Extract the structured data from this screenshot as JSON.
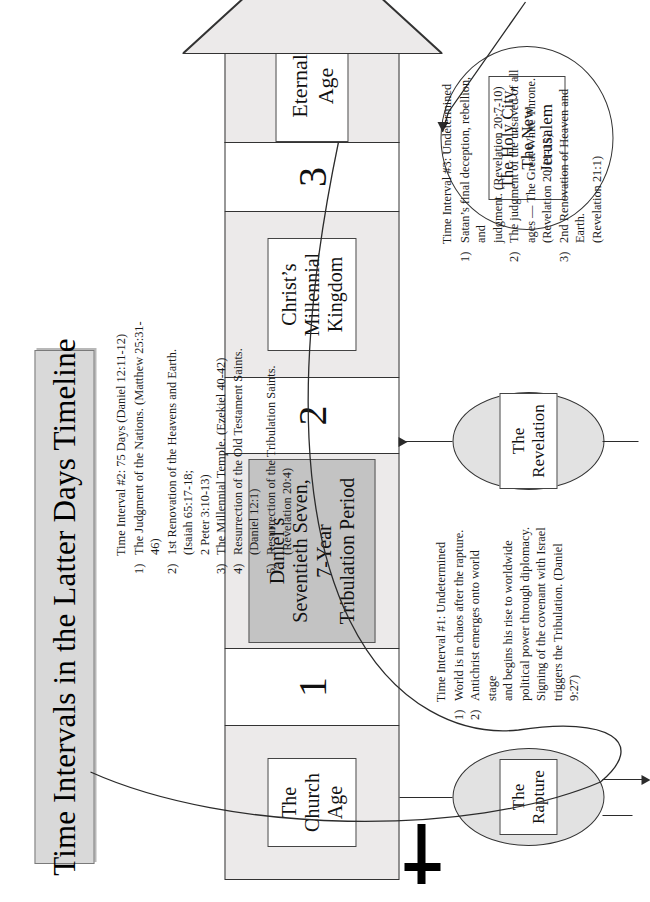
{
  "title": "Time Intervals in the Latter Days Timeline",
  "timeline": {
    "segments": [
      {
        "key": "church-age",
        "kind": "era",
        "label": "The Church Age"
      },
      {
        "key": "interval-1",
        "kind": "interval",
        "label": "1"
      },
      {
        "key": "tribulation",
        "kind": "era",
        "label": "Daniel’s Seventieth Seven, 7-Year Tribulation Period"
      },
      {
        "key": "interval-2",
        "kind": "interval",
        "label": "2"
      },
      {
        "key": "millennial-kingdom",
        "kind": "era",
        "label": "Christ’s Millennial Kingdom"
      },
      {
        "key": "interval-3",
        "kind": "interval",
        "label": "3"
      },
      {
        "key": "eternal-age",
        "kind": "era",
        "label": "Eternal Age"
      }
    ],
    "era_labels": {
      "church_age": [
        "The",
        "Church",
        "Age"
      ],
      "tribulation": [
        "Daniel’s",
        "Seventieth Seven,",
        "7-Year",
        "Tribulation Period"
      ],
      "millennial": [
        "Christ’s",
        "Millennial",
        "Kingdom"
      ],
      "eternal": [
        "Eternal Age"
      ]
    }
  },
  "callouts": {
    "rapture": [
      "The",
      "Rapture"
    ],
    "revelation": [
      "The",
      "Revelation"
    ],
    "holy_city": [
      "The Holy City,",
      "The New",
      "Jerusalem"
    ]
  },
  "notes": {
    "interval1": {
      "heading": "Time Interval #1: Undetermined",
      "items": [
        {
          "marker": "1)",
          "lines": [
            "World is in chaos after the rapture."
          ]
        },
        {
          "marker": "2)",
          "lines": [
            "Antichrist emerges onto world stage",
            "and begins his rise to worldwide",
            "political power through diplomacy.",
            "Signing of the covenant with Israel",
            "triggers the Tribulation. (Daniel 9:27)"
          ]
        }
      ]
    },
    "interval2": {
      "heading": "Time Interval #2: 75 Days (Daniel 12:11-12)",
      "items": [
        {
          "marker": "1)",
          "lines": [
            "The Judgment of the Nations. (Matthew 25:31-46)"
          ]
        },
        {
          "marker": "2)",
          "lines": [
            "1st Renovation of the Heavens and Earth. (Isaiah 65:17-18;",
            "2 Peter 3:10-13)"
          ]
        },
        {
          "marker": "3)",
          "lines": [
            "The Millennial Temple. (Ezekiel 40-42)"
          ]
        },
        {
          "marker": "4)",
          "lines": [
            "Resurrection of the Old Testament Saints. (Daniel 12:1)"
          ]
        },
        {
          "marker": "5)",
          "lines": [
            "Resurrection of the Tribulation Saints. (Revelation 20:4)"
          ]
        }
      ]
    },
    "interval3": {
      "heading": "Time Interval #3: Undetermined",
      "items": [
        {
          "marker": "1)",
          "lines": [
            "Satan’s final deception, rebellion, and",
            "judgment. (Revelation 20:7-10)"
          ]
        },
        {
          "marker": "2)",
          "lines": [
            "The judgment of the unsaved of all",
            "ages — The Great White Throne.",
            "(Revelation 20:11-15)"
          ]
        },
        {
          "marker": "3)",
          "lines": [
            "2nd Renovation of Heaven and Earth.",
            "(Revelation 21:1)"
          ]
        }
      ]
    }
  },
  "icons": {
    "cross": "cross-icon",
    "arrow_head": "timeline-arrowhead-icon"
  },
  "colors": {
    "banner_fill": "#d9d9d9",
    "era_fill": "#eceaea",
    "tribulation_fill": "#c3c3c3",
    "callout_fill": "#e2e2e2",
    "line": "#2b2b2b"
  }
}
